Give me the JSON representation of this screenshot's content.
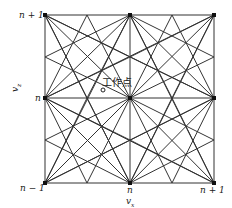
{
  "diagram": {
    "y_axis_label": "v_z",
    "x_axis_label": "v_x",
    "y_tick_labels": {
      "top": "n + 1",
      "middle": "n",
      "bottom": "n − 1"
    },
    "x_tick_labels": {
      "middle": "n",
      "right": "n + 1"
    },
    "operating_point_label": "工作点",
    "line_color": "#333333"
  }
}
